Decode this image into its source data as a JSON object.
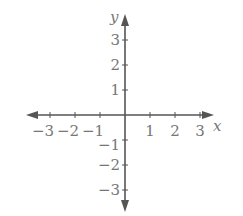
{
  "chart_data": {
    "type": "line",
    "title": "",
    "xlabel": "x",
    "ylabel": "y",
    "xlim": [
      -3,
      3
    ],
    "ylim": [
      -3,
      3
    ],
    "x_ticks": [
      -3,
      -2,
      -1,
      1,
      2,
      3
    ],
    "y_ticks": [
      -3,
      -2,
      -1,
      1,
      2,
      3
    ],
    "x_tick_labels": [
      "−3",
      "−2",
      "−1",
      "1",
      "2",
      "3"
    ],
    "y_tick_labels": [
      "−3",
      "−2",
      "−1",
      "1",
      "2",
      "3"
    ],
    "grid": false,
    "series": [],
    "axis_color": "#555555",
    "label_color": "#777777"
  }
}
